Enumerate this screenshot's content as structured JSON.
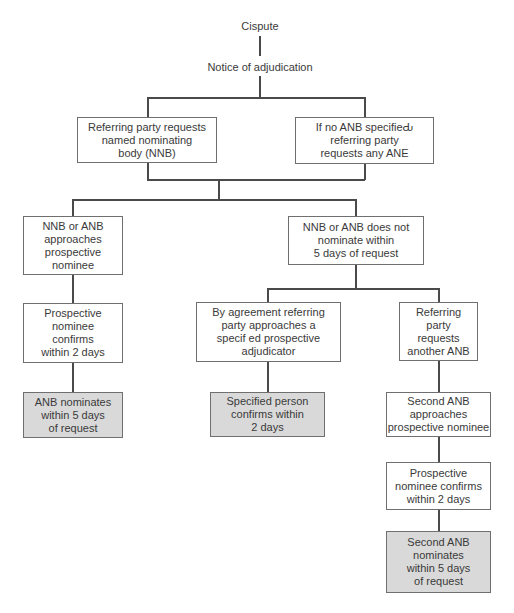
{
  "title_nodes": {
    "dispute": "Cispute",
    "notice": "Notice of adjudication"
  },
  "nodes": {
    "request_nnb": "Referring party requests\nnamed nominating\nbody (NNB)",
    "request_anb": "If no ANB specifieԂ\nreferring party\nrequests any ANE",
    "nnb_approaches": "NNB or ANB\napproaches\nprospective\nnominee",
    "nnb_not_nominate": "NNB or ANB does not\nnominate within\n5 days of request",
    "prospective_confirms": "Prospective\nnominee\nconfirms\nwithin 2 days",
    "by_agreement": "By agreement referring\nparty approaches a\nspecif ed prospective\nadjudicator",
    "request_another_anb": "Referring\nparty\nrequests\nanother ANB",
    "anb_nominates": "ANB nominates\nwithin 5 days\nof request",
    "specified_confirms": "Specified person\nconfirms within\n2 days",
    "second_anb_approaches": "Second ANB\napproaches\nprospective nominee",
    "second_prospective_confirms": "Prospective\nnominee confirms\nwithin 2 days",
    "second_anb_nominates": "Second ANB\nnominates\nwithin 5 days\nof request"
  },
  "colors": {
    "box_fill": "#ffffff",
    "terminal_fill": "#d9d9d9",
    "line": "#4a4a4a",
    "text": "#3a3a3a"
  }
}
